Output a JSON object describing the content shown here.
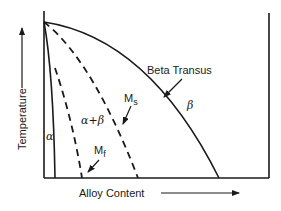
{
  "diagram": {
    "type": "phase-diagram",
    "axes": {
      "y_label": "Temperature",
      "x_label": "Alloy Content"
    },
    "regions": {
      "alpha": "α",
      "alpha_beta": "α+β",
      "beta": "β"
    },
    "curves": {
      "beta_transus": "Beta Transus",
      "ms_main": "M",
      "ms_sub": "s",
      "mf_main": "M",
      "mf_sub": "f"
    },
    "colors": {
      "ink": "#1a1a1a",
      "background": "#ffffff"
    }
  }
}
